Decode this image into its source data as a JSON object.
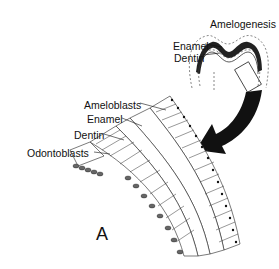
{
  "inset": {
    "title": "Amelogenesis",
    "labels": {
      "enamel": "Enamel",
      "dentin": "Dentin"
    }
  },
  "main": {
    "labels": {
      "ameloblasts": "Ameloblasts",
      "enamel": "Enamel",
      "dentin": "Dentin",
      "odontoblasts": "Odontoblasts"
    },
    "panel_letter": "A"
  },
  "colors": {
    "ink": "#111111",
    "background": "#ffffff",
    "dashed": "#555555"
  }
}
